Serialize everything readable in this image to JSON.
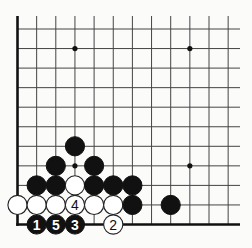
{
  "diagram": {
    "type": "go-board-corner",
    "view": "bottom-left corner",
    "columns_visible": 12,
    "rows_visible": 11,
    "hoshi": [
      {
        "col": 3,
        "row": 9
      },
      {
        "col": 9,
        "row": 9
      },
      {
        "col": 3,
        "row": 3
      },
      {
        "col": 9,
        "row": 3
      }
    ],
    "stones": [
      {
        "color": "black",
        "col": 3,
        "row": 4,
        "label": ""
      },
      {
        "color": "black",
        "col": 2,
        "row": 3,
        "label": ""
      },
      {
        "color": "black",
        "col": 4,
        "row": 3,
        "label": ""
      },
      {
        "color": "black",
        "col": 1,
        "row": 2,
        "label": ""
      },
      {
        "color": "black",
        "col": 2,
        "row": 2,
        "label": ""
      },
      {
        "color": "white",
        "col": 3,
        "row": 2,
        "label": ""
      },
      {
        "color": "black",
        "col": 4,
        "row": 2,
        "label": ""
      },
      {
        "color": "black",
        "col": 5,
        "row": 2,
        "label": ""
      },
      {
        "color": "black",
        "col": 6,
        "row": 2,
        "label": ""
      },
      {
        "color": "white",
        "col": 0,
        "row": 1,
        "label": ""
      },
      {
        "color": "white",
        "col": 1,
        "row": 1,
        "label": ""
      },
      {
        "color": "white",
        "col": 2,
        "row": 1,
        "label": ""
      },
      {
        "color": "white",
        "col": 3,
        "row": 1,
        "label": "4"
      },
      {
        "color": "white",
        "col": 4,
        "row": 1,
        "label": ""
      },
      {
        "color": "white",
        "col": 5,
        "row": 1,
        "label": ""
      },
      {
        "color": "black",
        "col": 6,
        "row": 1,
        "label": ""
      },
      {
        "color": "black",
        "col": 8,
        "row": 1,
        "label": ""
      },
      {
        "color": "black",
        "col": 1,
        "row": 0,
        "label": "1"
      },
      {
        "color": "black",
        "col": 2,
        "row": 0,
        "label": "5"
      },
      {
        "color": "black",
        "col": 3,
        "row": 0,
        "label": "3"
      },
      {
        "color": "white",
        "col": 5,
        "row": 0,
        "label": "2"
      }
    ]
  }
}
